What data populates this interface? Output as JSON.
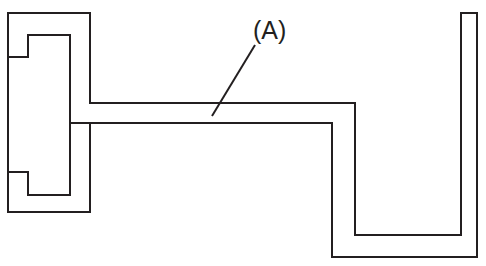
{
  "figure": {
    "kind": "technical-line-drawing",
    "background_color": "#ffffff",
    "line_color": "#231f20",
    "line_width": 2,
    "canvas": {
      "width": 486,
      "height": 266
    }
  },
  "callouts": [
    {
      "id": "callout-a",
      "label": "(A)",
      "text_x": 253,
      "text_y": 18,
      "font_size": 25,
      "leader": {
        "x1": 255,
        "y1": 45,
        "x2": 212,
        "y2": 116
      }
    }
  ],
  "shapes": {
    "main_profile": {
      "name": "bracket-profile",
      "points": "8,13 90,13 90,103 355,103 355,235 461,235 461,13 477,13 477,257 332,257 332,123 90,123 90,212 8,212 8,172 70,172 70,195 28,195 28,172 28,57 70,57 70,35 28,35 28,57 8,57"
    },
    "outer_path": {
      "name": "bracket-outer-path",
      "d": "M 8,13 L 90,13 L 90,103 L 355,103 L 355,235 L 461,235 L 461,13 L 477,13 L 477,257 L 332,257 L 332,123 L 70,123 L 70,195 L 28,195 L 28,172 L 8,172 L 8,57 L 28,57 L 28,35 L 70,35 L 70,123 L 90,123 L 90,212 L 8,212 Z"
    },
    "segments": [
      {
        "name": "top-edge",
        "x1": 8,
        "y1": 13,
        "x2": 90,
        "y2": 13
      },
      {
        "name": "upper-right-vertical",
        "x1": 90,
        "y1": 13,
        "x2": 90,
        "y2": 103
      },
      {
        "name": "upper-arm-top",
        "x1": 90,
        "y1": 103,
        "x2": 355,
        "y2": 103
      },
      {
        "name": "arm-right-outer",
        "x1": 355,
        "y1": 103,
        "x2": 355,
        "y2": 235
      },
      {
        "name": "arm-bottom-inner",
        "x1": 355,
        "y1": 235,
        "x2": 461,
        "y2": 235
      },
      {
        "name": "right-bar-inner",
        "x1": 461,
        "y1": 235,
        "x2": 461,
        "y2": 13
      },
      {
        "name": "right-bar-top",
        "x1": 461,
        "y1": 13,
        "x2": 477,
        "y2": 13
      },
      {
        "name": "right-bar-outer",
        "x1": 477,
        "y1": 13,
        "x2": 477,
        "y2": 257
      },
      {
        "name": "bottom-right-edge",
        "x1": 477,
        "y1": 257,
        "x2": 332,
        "y2": 257
      },
      {
        "name": "arm-right-inner",
        "x1": 332,
        "y1": 257,
        "x2": 332,
        "y2": 123
      },
      {
        "name": "lower-arm-bottom",
        "x1": 332,
        "y1": 123,
        "x2": 70,
        "y2": 123
      },
      {
        "name": "lower-inner-vertical",
        "x1": 70,
        "y1": 123,
        "x2": 70,
        "y2": 195
      },
      {
        "name": "lower-notch-bottom",
        "x1": 70,
        "y1": 195,
        "x2": 28,
        "y2": 195
      },
      {
        "name": "lower-notch-left",
        "x1": 28,
        "y1": 195,
        "x2": 28,
        "y2": 172
      },
      {
        "name": "lower-notch-top",
        "x1": 28,
        "y1": 172,
        "x2": 8,
        "y2": 172
      },
      {
        "name": "left-inner-edge",
        "x1": 8,
        "y1": 172,
        "x2": 8,
        "y2": 57
      },
      {
        "name": "upper-notch-bottom",
        "x1": 8,
        "y1": 57,
        "x2": 28,
        "y2": 57
      },
      {
        "name": "upper-notch-right",
        "x1": 28,
        "y1": 57,
        "x2": 28,
        "y2": 35
      },
      {
        "name": "upper-notch-top",
        "x1": 28,
        "y1": 35,
        "x2": 70,
        "y2": 35
      },
      {
        "name": "upper-inner-vertical",
        "x1": 70,
        "y1": 35,
        "x2": 70,
        "y2": 123
      },
      {
        "name": "mid-step-vertical",
        "x1": 90,
        "y1": 123,
        "x2": 90,
        "y2": 212
      },
      {
        "name": "bottom-left-edge",
        "x1": 90,
        "y1": 212,
        "x2": 8,
        "y2": 212
      },
      {
        "name": "left-outer-lower",
        "x1": 8,
        "y1": 212,
        "x2": 8,
        "y2": 172
      },
      {
        "name": "left-outer-upper",
        "x1": 8,
        "y1": 57,
        "x2": 8,
        "y2": 13
      }
    ]
  }
}
